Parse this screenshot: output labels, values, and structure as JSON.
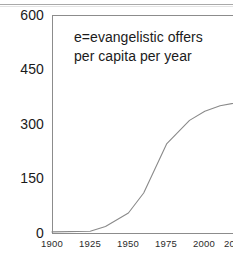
{
  "figure": {
    "annotation": "e=evangelistic offers\nper capita per year",
    "axis_color": "#8c8c8c",
    "line_color": "#8a8a8a",
    "text_color": "#1a1a1a",
    "background": "#ffffff"
  },
  "chart_data": {
    "type": "line",
    "title": "",
    "subtitle": "",
    "xlabel": "",
    "ylabel": "",
    "annotations": [
      "e=evangelistic offers per capita per year"
    ],
    "legend": [],
    "legend_position": "none",
    "grid": false,
    "xlim": [
      1900,
      2025
    ],
    "ylim": [
      0,
      600
    ],
    "xticks": [
      1900,
      1925,
      1950,
      1975,
      2000,
      2025
    ],
    "xtick_labels": [
      "1900",
      "1925",
      "1950",
      "1975",
      "2000",
      "2025"
    ],
    "xtick_last_clipped": true,
    "xtick_last_visible_text": "20",
    "yticks": [
      0,
      150,
      300,
      450,
      600
    ],
    "ytick_labels": [
      "0",
      "150",
      "300",
      "450",
      "600"
    ],
    "x": [
      1900,
      1925,
      1935,
      1950,
      1960,
      1975,
      1990,
      2000,
      2010,
      2025
    ],
    "values": [
      3,
      5,
      18,
      55,
      110,
      245,
      310,
      335,
      350,
      362
    ],
    "series": [
      {
        "name": "e = evangelistic offers per capita per year",
        "x": [
          1900,
          1925,
          1935,
          1950,
          1960,
          1975,
          1990,
          2000,
          2010,
          2025
        ],
        "values": [
          3,
          5,
          18,
          55,
          110,
          245,
          310,
          335,
          350,
          362
        ]
      }
    ]
  },
  "yaxis": {
    "labels": [
      {
        "text": "600",
        "top": 8
      },
      {
        "text": "450",
        "top": 62
      },
      {
        "text": "300",
        "top": 117
      },
      {
        "text": "150",
        "top": 171
      },
      {
        "text": "0",
        "top": 226
      }
    ]
  },
  "xaxis": {
    "labels": [
      {
        "text": "1900",
        "left": 38,
        "width": 28
      },
      {
        "text": "1925",
        "left": 76,
        "width": 28
      },
      {
        "text": "1950",
        "left": 114,
        "width": 28
      },
      {
        "text": "1975",
        "left": 152,
        "width": 28
      },
      {
        "text": "2000",
        "left": 190,
        "width": 28
      },
      {
        "text": "20",
        "left": 224,
        "width": 16
      }
    ]
  }
}
